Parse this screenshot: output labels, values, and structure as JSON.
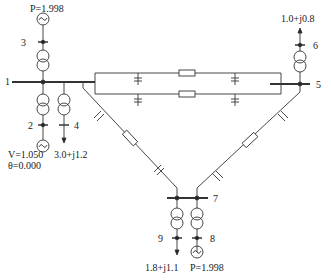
{
  "diagram": {
    "type": "power-system-single-line",
    "buses": [
      {
        "id": "1",
        "label": "1"
      },
      {
        "id": "2",
        "label": "2"
      },
      {
        "id": "3",
        "label": "3"
      },
      {
        "id": "4",
        "label": "4"
      },
      {
        "id": "5",
        "label": "5"
      },
      {
        "id": "6",
        "label": "6"
      },
      {
        "id": "7",
        "label": "7"
      },
      {
        "id": "8",
        "label": "8"
      },
      {
        "id": "9",
        "label": "9"
      }
    ],
    "annotations": {
      "gen3": "P=1.998",
      "gen2_v": "V=1.050",
      "gen2_theta": "θ=0.000",
      "load4": "3.0+j1.2",
      "load6": "1.0+j0.8",
      "load9": "1.8+j1.1",
      "gen8": "P=1.998"
    }
  }
}
